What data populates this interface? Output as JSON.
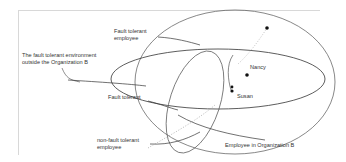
{
  "diagram": {
    "labels": {
      "fault_tolerant_employee_line1": "Fault tolerant",
      "fault_tolerant_employee_line2": "employee",
      "environment_line1": "The fault tolerant environment",
      "environment_line2": "outside the Organization B",
      "fault_tolerant": "Fault tolerant",
      "non_fault_tolerant_line1": "non-fault tolerant",
      "non_fault_tolerant_line2": "employee",
      "nancy": "Nancy",
      "susan": "Susan",
      "employee_in_org_b": "Employee   in Organization B"
    },
    "colors": {
      "stroke": "#333333",
      "frame": "#d8d8d8",
      "text": "#333333",
      "dot": "#111111"
    }
  }
}
